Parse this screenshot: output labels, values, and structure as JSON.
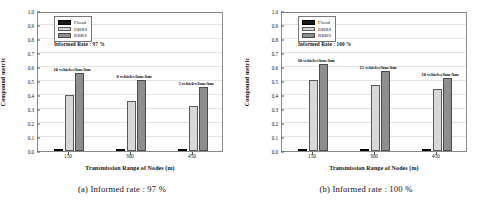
{
  "figure": {
    "panels": [
      {
        "id": "panel-a",
        "caption": "(a) Informed rate : 97 %",
        "rate_note": "Informed Rate : 97 %",
        "chart_data": {
          "type": "bar",
          "title": "",
          "xlabel": "Transmission Range of Nodes (m)",
          "ylabel": "Compound metric",
          "categories": [
            "150",
            "300",
            "450"
          ],
          "ylim": [
            0.0,
            1.0
          ],
          "ytick_labels": [
            "0.0",
            "0.1",
            "0.2",
            "0.3",
            "0.4",
            "0.5",
            "0.6",
            "0.7",
            "0.8",
            "0.9",
            "1.0"
          ],
          "grid": true,
          "legend_position": "top-left",
          "series": [
            {
              "name": "Flood",
              "color": "#1a1a1a",
              "values": [
                0.007,
                0.008,
                0.012
              ]
            },
            {
              "name": "DBRS",
              "color": "#d8d8d8",
              "values": [
                0.4,
                0.355,
                0.325
              ]
            },
            {
              "name": "RBRS",
              "color": "#8e8e8e",
              "values": [
                0.56,
                0.505,
                0.455
              ]
            }
          ],
          "annotations": [
            {
              "category": "150",
              "text": "10 vehicles/lane/km"
            },
            {
              "category": "300",
              "text": "8 vehicles/lane/km"
            },
            {
              "category": "450",
              "text": "5 vehicles/lane/km"
            }
          ]
        }
      },
      {
        "id": "panel-b",
        "caption": "(b) Informed rate : 100 %",
        "rate_note": "Informed Rate : 100 %",
        "chart_data": {
          "type": "bar",
          "title": "",
          "xlabel": "Transmission Range of Nodes (m)",
          "ylabel": "Compound metric",
          "categories": [
            "150",
            "300",
            "450"
          ],
          "ylim": [
            0.0,
            1.0
          ],
          "ytick_labels": [
            "0.0",
            "0.1",
            "0.2",
            "0.3",
            "0.4",
            "0.5",
            "0.6",
            "0.7",
            "0.8",
            "0.9",
            "1.0"
          ],
          "grid": true,
          "legend_position": "top-left",
          "series": [
            {
              "name": "Flood",
              "color": "#1a1a1a",
              "values": [
                0.004,
                0.004,
                0.004
              ]
            },
            {
              "name": "DBRS",
              "color": "#d8d8d8",
              "values": [
                0.51,
                0.47,
                0.44
              ]
            },
            {
              "name": "RBRS",
              "color": "#8e8e8e",
              "values": [
                0.62,
                0.57,
                0.52
              ]
            }
          ],
          "annotations": [
            {
              "category": "150",
              "text": "30 vehicles/lane/km"
            },
            {
              "category": "300",
              "text": "15 vehicles/lane/km"
            },
            {
              "category": "450",
              "text": "10 vehicles/lane/km"
            }
          ]
        }
      }
    ]
  }
}
